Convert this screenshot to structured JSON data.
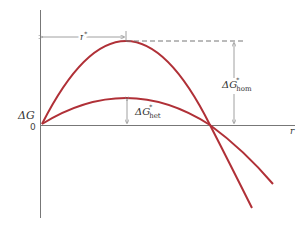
{
  "diagram": {
    "colors": {
      "curve": "#b03037",
      "axis": "#777777",
      "annotation": "#888888",
      "text": "#333333"
    },
    "axes": {
      "y_label": "ΔG",
      "x_label": "r",
      "origin_label": "0"
    },
    "curves": [
      {
        "name": "homogeneous",
        "peak": "ΔG*hom at r*"
      },
      {
        "name": "heterogeneous",
        "peak": "ΔG*het at r*"
      }
    ],
    "annotations": {
      "r_star": {
        "base": "r",
        "sup": "*"
      },
      "dg_hom": {
        "base": "ΔG",
        "sup": "*",
        "sub": "hom"
      },
      "dg_het": {
        "base": "ΔG",
        "sup": "*",
        "sub": "het"
      }
    }
  }
}
